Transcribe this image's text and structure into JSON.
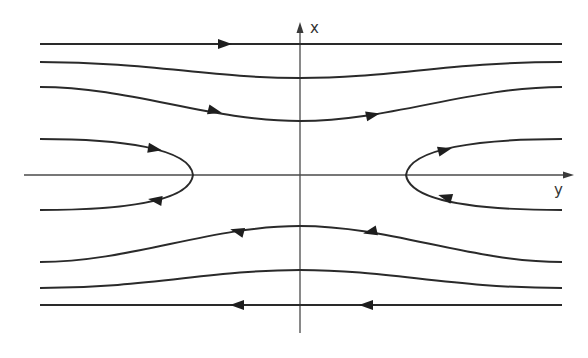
{
  "diagram": {
    "colors": {
      "trajectory": "#2a2a2a",
      "axis": "#4a4a4a",
      "background": "#ffffff"
    },
    "axes": {
      "vertical": {
        "label": "x",
        "x": 300,
        "y_top": 22,
        "y_bottom": 333
      },
      "horizontal": {
        "label": "y",
        "y": 175,
        "x_left": 24,
        "x_right": 574
      }
    },
    "trajectories": [
      {
        "id": "top-line",
        "path": "M40 44 L562 44",
        "direction": "right",
        "arrows": [
          {
            "x": 225,
            "y": 44,
            "angle": 0
          }
        ]
      },
      {
        "id": "upper-curve-1",
        "path": "M40 62 C150 62 210 78 300 78 C390 78 450 62 562 62",
        "direction": "none",
        "arrows": []
      },
      {
        "id": "upper-curve-2",
        "path": "M40 87 C130 87 210 121 300 121 C390 121 470 87 562 87",
        "direction": "right",
        "arrows": [
          {
            "x": 215,
            "y": 111,
            "angle": 14
          },
          {
            "x": 373,
            "y": 115,
            "angle": -12
          }
        ]
      },
      {
        "id": "left-hyperbola",
        "path": "M40 139 C120 139 190 148 193 175 C190 202 120 210 40 210",
        "direction": "in-top-out-bottom",
        "arrows": [
          {
            "x": 155,
            "y": 149,
            "angle": 10
          },
          {
            "x": 155,
            "y": 200,
            "angle": 188
          }
        ]
      },
      {
        "id": "right-hyperbola",
        "path": "M562 139 C480 139 410 148 406 175 C410 202 480 210 562 210",
        "direction": "in-bottom-out-top",
        "arrows": [
          {
            "x": 445,
            "y": 150,
            "angle": -14
          },
          {
            "x": 445,
            "y": 197,
            "angle": 196
          }
        ]
      },
      {
        "id": "lower-curve-1",
        "path": "M40 262 C130 262 210 226 300 226 C390 226 470 262 562 262",
        "direction": "left",
        "arrows": [
          {
            "x": 237,
            "y": 231,
            "angle": 195
          },
          {
            "x": 370,
            "y": 232,
            "angle": 167
          }
        ]
      },
      {
        "id": "lower-curve-2",
        "path": "M40 288 C150 288 210 270 300 270 C390 270 450 288 562 288",
        "direction": "none",
        "arrows": []
      },
      {
        "id": "bottom-line",
        "path": "M40 305 L562 305",
        "direction": "left",
        "arrows": [
          {
            "x": 237,
            "y": 305,
            "angle": 180
          },
          {
            "x": 366,
            "y": 305,
            "angle": 180
          }
        ]
      }
    ]
  }
}
